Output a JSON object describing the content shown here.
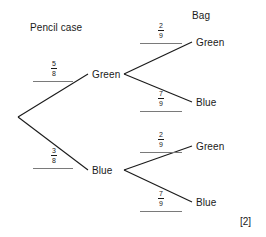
{
  "diagram": {
    "type": "probability-tree",
    "stages": [
      {
        "id": "stage-1",
        "heading": "Pencil case"
      },
      {
        "id": "stage-2",
        "heading": "Bag"
      }
    ],
    "root": {
      "label": ""
    },
    "branches_stage1": [
      {
        "id": "b1",
        "probability_numerator": "5",
        "probability_denominator": "8",
        "target_label": "Green"
      },
      {
        "id": "b2",
        "probability_numerator": "3",
        "probability_denominator": "8",
        "target_label": "Blue"
      }
    ],
    "branches_stage2": [
      {
        "id": "b1a",
        "parent": "Green",
        "probability_numerator": "2",
        "probability_denominator": "9",
        "target_label": "Green"
      },
      {
        "id": "b1b",
        "parent": "Green",
        "probability_numerator": "7",
        "probability_denominator": "9",
        "target_label": "Blue"
      },
      {
        "id": "b2a",
        "parent": "Blue",
        "probability_numerator": "2",
        "probability_denominator": "9",
        "target_label": "Green"
      },
      {
        "id": "b2b",
        "parent": "Blue",
        "probability_numerator": "7",
        "probability_denominator": "9",
        "target_label": "Blue"
      }
    ],
    "marks": "[2]",
    "colors": {
      "line": "#1a1a1a",
      "text": "#1a1a1a",
      "rule": "#7a7a7a",
      "background": "#ffffff"
    }
  }
}
